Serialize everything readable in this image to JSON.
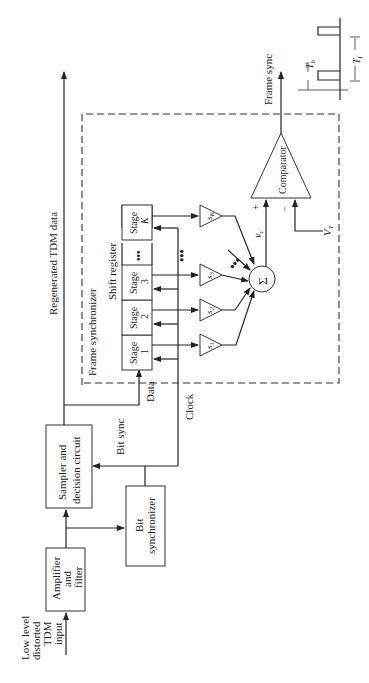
{
  "diagram": {
    "orientation": "rotated-90-ccw",
    "blocks": {
      "amplifier": {
        "line1": "Amplifier",
        "line2": "and",
        "line3": "filter"
      },
      "sampler": {
        "line1": "Sampler and",
        "line2": "decision circuit"
      },
      "bit_sync": {
        "line1": "Bit",
        "line2": "synchronizer"
      },
      "comparator": "Comparator",
      "summer": "Σ"
    },
    "labels": {
      "input": {
        "line1": "Low level",
        "line2": "distorted",
        "line3": "TDM",
        "line4": "input"
      },
      "regenerated": "Regenerated TDM data",
      "frame_synchronizer": "Frame synchronizer",
      "shift_register": "Shift register",
      "data": "Data",
      "clock": "Clock",
      "bit_sync_signal": "Bit sync",
      "frame_sync": "Frame sync",
      "vc": "v",
      "vc_sub": "c",
      "vt": "V",
      "vt_sub": "T",
      "plus": "+",
      "minus": "−",
      "tb": "T",
      "tb_sub": "b",
      "tf": "T",
      "tf_sub": "f"
    },
    "stages": [
      {
        "l1": "Stage",
        "l2": "1"
      },
      {
        "l1": "Stage",
        "l2": "2"
      },
      {
        "l1": "Stage",
        "l2": "3"
      },
      {
        "l1": "",
        "l2": "•••"
      },
      {
        "l1": "Stage",
        "l2": "K"
      }
    ],
    "weights": [
      {
        "s": "s",
        "sub": "1"
      },
      {
        "s": "s",
        "sub": "2"
      },
      {
        "s": "s",
        "sub": "3"
      },
      {
        "s": "s",
        "sub": "K"
      }
    ]
  }
}
